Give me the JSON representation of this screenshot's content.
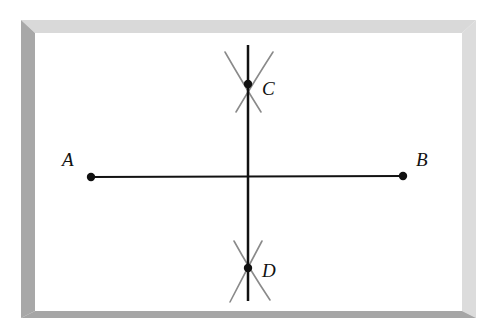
{
  "diagram": {
    "type": "perpendicular-bisector-construction",
    "frame": {
      "outer": {
        "x": 21,
        "y": 20,
        "w": 455,
        "h": 298
      },
      "inner": {
        "x": 35,
        "y": 33,
        "w": 427,
        "h": 278
      },
      "top_color": "#d9d9d9",
      "left_color": "#a8a8a8",
      "right_color": "#dcdcdc",
      "bottom_color": "#a6a6a6"
    },
    "points": [
      {
        "name": "A",
        "x": 91,
        "y": 177,
        "label_x": 62,
        "label_y": 166
      },
      {
        "name": "B",
        "x": 403,
        "y": 176,
        "label_x": 416,
        "label_y": 166
      },
      {
        "name": "C",
        "x": 248,
        "y": 84,
        "label_x": 262,
        "label_y": 95
      },
      {
        "name": "D",
        "x": 248,
        "y": 268,
        "label_x": 262,
        "label_y": 277
      }
    ],
    "segments": [
      {
        "name": "segment-AB",
        "x1": 91,
        "y1": 177,
        "x2": 403,
        "y2": 176,
        "color": "#111111",
        "width": 2
      },
      {
        "name": "bisector-CD",
        "x1": 248,
        "y1": 45,
        "x2": 248,
        "y2": 301,
        "color": "#111111",
        "width": 2.5
      }
    ],
    "arcs": [
      {
        "name": "arc-c-1",
        "x1": 225,
        "y1": 52,
        "x2": 261,
        "y2": 112
      },
      {
        "name": "arc-c-2",
        "x1": 273,
        "y1": 52,
        "x2": 236,
        "y2": 112
      },
      {
        "name": "arc-d-1",
        "x1": 234,
        "y1": 241,
        "x2": 270,
        "y2": 300
      },
      {
        "name": "arc-d-2",
        "x1": 262,
        "y1": 241,
        "x2": 230,
        "y2": 302
      }
    ],
    "arc_color": "#8a8a8a"
  }
}
